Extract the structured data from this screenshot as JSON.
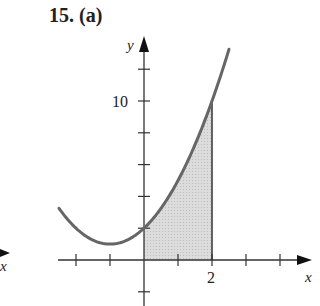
{
  "title": "15.  (a)",
  "chart_data": {
    "type": "line",
    "title": "15. (a)",
    "function": "y = x^2 + 2x + 2",
    "xlabel": "x",
    "ylabel": "y",
    "x_tick_labels": [
      {
        "x": 2,
        "label": "2"
      }
    ],
    "y_tick_labels": [
      {
        "y": 10,
        "label": "10"
      }
    ],
    "x_ticks": [
      -2,
      -1,
      1,
      2,
      3,
      4
    ],
    "y_ticks": [
      -2,
      2,
      4,
      6,
      8,
      10,
      12
    ],
    "xlim": [
      -2.5,
      5
    ],
    "ylim": [
      -3,
      14
    ],
    "series": [
      {
        "name": "curve",
        "x": [
          -2.5,
          -2,
          -1,
          0,
          1,
          2,
          2.5
        ],
        "y": [
          3.25,
          2,
          1,
          2,
          5,
          10,
          13.25
        ]
      }
    ],
    "shaded_region": {
      "from_x": 0,
      "to_x": 2,
      "description": "area under curve between x=0 and x=2",
      "fill": "#d9d9d9"
    },
    "grid": false,
    "fragment_label": "x"
  },
  "labels": {
    "y_axis": "y",
    "x_axis": "x",
    "tick_10": "10",
    "tick_2": "2",
    "left_fragment_x": "x"
  }
}
